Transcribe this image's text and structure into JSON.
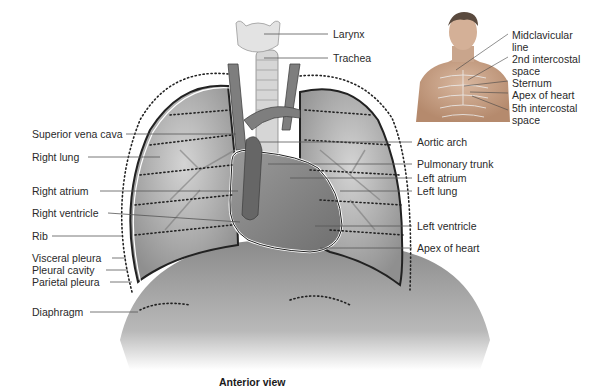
{
  "caption": "Anterior view",
  "main_labels_left": [
    {
      "text": "Superior vena cava",
      "x": 32,
      "y": 128
    },
    {
      "text": "Right lung",
      "x": 32,
      "y": 151
    },
    {
      "text": "Right atrium",
      "x": 32,
      "y": 185
    },
    {
      "text": "Right ventricle",
      "x": 32,
      "y": 207
    },
    {
      "text": "Rib",
      "x": 32,
      "y": 230
    },
    {
      "text": "Visceral pleura",
      "x": 32,
      "y": 252
    },
    {
      "text": "Pleural cavity",
      "x": 32,
      "y": 264
    },
    {
      "text": "Parietal pleura",
      "x": 32,
      "y": 276
    },
    {
      "text": "Diaphragm",
      "x": 32,
      "y": 306
    }
  ],
  "main_labels_right": [
    {
      "text": "Larynx",
      "x": 333,
      "y": 28
    },
    {
      "text": "Trachea",
      "x": 333,
      "y": 52
    },
    {
      "text": "Aortic arch",
      "x": 417,
      "y": 136
    },
    {
      "text": "Pulmonary trunk",
      "x": 417,
      "y": 158
    },
    {
      "text": "Left atrium",
      "x": 417,
      "y": 172
    },
    {
      "text": "Left lung",
      "x": 417,
      "y": 185
    },
    {
      "text": "Left ventricle",
      "x": 417,
      "y": 220
    },
    {
      "text": "Apex of heart",
      "x": 417,
      "y": 242
    }
  ],
  "inset_labels": [
    {
      "text": "Midclavicular",
      "x": 512,
      "y": 29
    },
    {
      "text": "line",
      "x": 512,
      "y": 41
    },
    {
      "text": "2nd intercostal",
      "x": 512,
      "y": 53
    },
    {
      "text": "space",
      "x": 512,
      "y": 65
    },
    {
      "text": "Sternum",
      "x": 512,
      "y": 77
    },
    {
      "text": "Apex of heart",
      "x": 512,
      "y": 89
    },
    {
      "text": "5th intercostal",
      "x": 512,
      "y": 102
    },
    {
      "text": "space",
      "x": 512,
      "y": 114
    }
  ],
  "colors": {
    "text": "#2a2a2a",
    "lines": "#555555",
    "organ_gray": "#9a9a9a",
    "dotted": "#333333"
  }
}
